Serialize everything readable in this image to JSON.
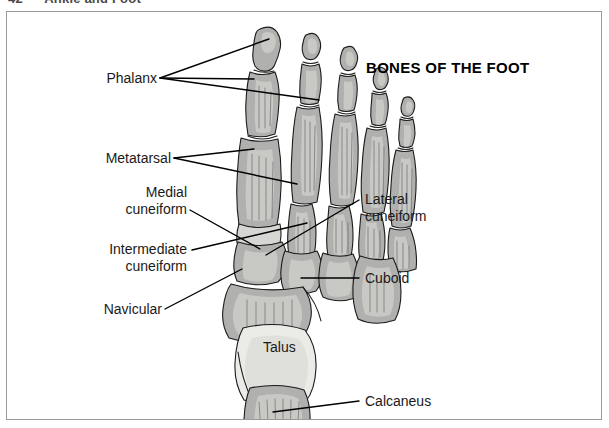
{
  "running_head": {
    "page_number": "42",
    "section_title": "Ankle and Foot"
  },
  "figure": {
    "title": "BONES OF THE FOOT",
    "view": "dorsal view of right foot",
    "labels": [
      {
        "id": "phalanx",
        "text_line1": "Phalanx",
        "text_line2": "",
        "side": "left"
      },
      {
        "id": "metatarsal",
        "text_line1": "Metatarsal",
        "text_line2": "",
        "side": "left"
      },
      {
        "id": "medial-cuneiform",
        "text_line1": "Medial",
        "text_line2": "cuneiform",
        "side": "left"
      },
      {
        "id": "intermediate-cuneiform",
        "text_line1": "Intermediate",
        "text_line2": "cuneiform",
        "side": "left"
      },
      {
        "id": "navicular",
        "text_line1": "Navicular",
        "text_line2": "",
        "side": "left"
      },
      {
        "id": "lateral-cuneiform",
        "text_line1": "Lateral",
        "text_line2": "cuneiform",
        "side": "right"
      },
      {
        "id": "cuboid",
        "text_line1": "Cuboid",
        "text_line2": "",
        "side": "right"
      },
      {
        "id": "calcaneus",
        "text_line1": "Calcaneus",
        "text_line2": "",
        "side": "right"
      },
      {
        "id": "talus",
        "text_line1": "Talus",
        "text_line2": "",
        "side": "inline"
      }
    ],
    "colors": {
      "bone_fill": "#b0b0ae",
      "bone_fill_light": "#d6d6d3",
      "talus_fill": "#ebebe8",
      "outline": "#1b1b1b",
      "leader_line": "#000000",
      "border": "#9a9a9a",
      "background": "#ffffff",
      "text": "#1a1a1a",
      "running_head_text": "#4a4a4a"
    }
  }
}
